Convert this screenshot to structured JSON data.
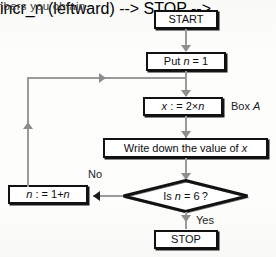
{
  "page": {
    "caption_fragment": "nbers you obtain."
  },
  "flowchart": {
    "title": "Flowchart producing multiples of 2",
    "nodes": [
      {
        "id": "start",
        "shape": "terminator",
        "label": "START"
      },
      {
        "id": "put_n",
        "shape": "process",
        "label": "Put n = 1"
      },
      {
        "id": "assign_x",
        "shape": "process",
        "label": "x : = 2×n"
      },
      {
        "id": "write_x",
        "shape": "process",
        "label": "Write down the value of x"
      },
      {
        "id": "decision",
        "shape": "decision",
        "label": "Is n = 6 ?"
      },
      {
        "id": "incr_n",
        "shape": "process",
        "label": "n : = 1+n"
      },
      {
        "id": "stop",
        "shape": "terminator",
        "label": "STOP"
      }
    ],
    "edge_labels": {
      "no": "No",
      "yes": "Yes"
    },
    "annotations": [
      {
        "id": "box_a",
        "text": "Box A"
      }
    ],
    "colors": {
      "node_border": "#111111",
      "node_fill": "#ffffff",
      "connector": "#9a9a9a",
      "text": "#0d0d0d"
    }
  }
}
